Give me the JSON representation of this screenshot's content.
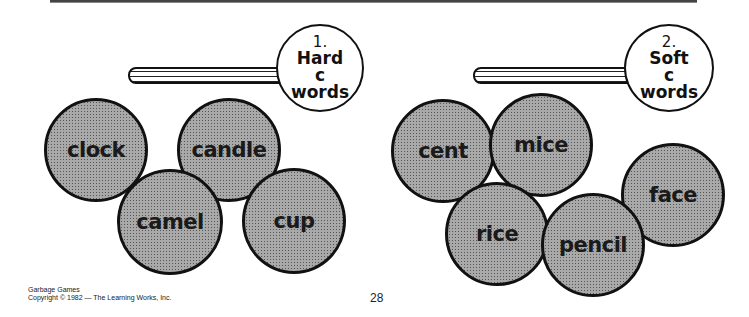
{
  "signs": [
    {
      "number": "1.",
      "lines": [
        "Hard",
        "c",
        "words"
      ]
    },
    {
      "number": "2.",
      "lines": [
        "Soft",
        "c",
        "words"
      ]
    }
  ],
  "hard_c_words": [
    "clock",
    "candle",
    "camel",
    "cup"
  ],
  "soft_c_words": [
    "cent",
    "mice",
    "rice",
    "pencil",
    "face"
  ],
  "footer": {
    "line1": "Garbage Games",
    "line2": "Copyright © 1982 — The Learning Works, Inc."
  },
  "page_number": "28"
}
